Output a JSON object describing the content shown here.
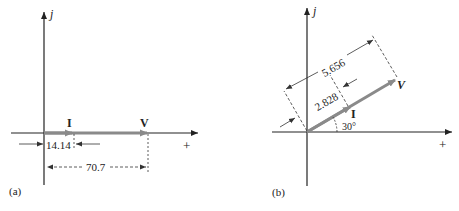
{
  "panels": [
    {
      "id": "a",
      "caption": "(a)",
      "axis_imag_label": "j",
      "axis_real_label": "+",
      "phasors": [
        {
          "name": "I",
          "label": "I",
          "angle_deg": 0
        },
        {
          "name": "V",
          "label": "V",
          "angle_deg": 0
        }
      ],
      "dimensions": [
        {
          "for": "I",
          "value": "14.14"
        },
        {
          "for": "V",
          "value": "70.7"
        }
      ]
    },
    {
      "id": "b",
      "caption": "(b)",
      "axis_imag_label": "j",
      "axis_real_label": "+",
      "phasors": [
        {
          "name": "I",
          "label": "I",
          "angle_deg": 30
        },
        {
          "name": "V",
          "label": "V",
          "angle_deg": 30
        }
      ],
      "dimensions": [
        {
          "for": "I",
          "value": "2.828"
        },
        {
          "for": "V",
          "value": "5.656"
        }
      ],
      "angle_label": "30°"
    }
  ],
  "colors": {
    "axis": "#222222",
    "phasor": "#8a8a8a",
    "dimension": "#333333"
  }
}
